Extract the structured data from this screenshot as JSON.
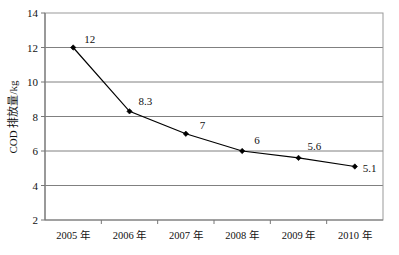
{
  "chart_data": {
    "type": "line",
    "title": "",
    "xlabel": "",
    "ylabel": "COD 排放量/kg",
    "categories": [
      "2005 年",
      "2006 年",
      "2007 年",
      "2008 年",
      "2009 年",
      "2010 年"
    ],
    "values": [
      12,
      8.3,
      7,
      6,
      5.6,
      5.1
    ],
    "point_labels": [
      "12",
      "8.3",
      "7",
      "6",
      "5.6",
      "5.1"
    ],
    "ylim": [
      2,
      14
    ],
    "yticks": [
      "2",
      "4",
      "6",
      "8",
      "10",
      "12",
      "14"
    ],
    "ytick_values": [
      2,
      4,
      6,
      8,
      10,
      12,
      14
    ],
    "grid": "horizontal",
    "legend": "none",
    "series": [
      {
        "name": "COD 排放量",
        "values": [
          12,
          8.3,
          7,
          6,
          5.6,
          5.1
        ]
      }
    ],
    "colors": {
      "line": "#000000",
      "marker": "#000000",
      "grid": "#808080",
      "frame": "#999999",
      "background": "#ffffff",
      "text": "#111111"
    }
  }
}
